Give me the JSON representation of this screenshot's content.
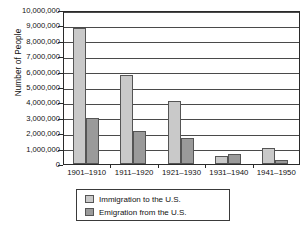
{
  "chart_data": {
    "type": "bar",
    "title": "",
    "xlabel": "",
    "ylabel": "Number of People",
    "ylim": [
      0,
      10000000
    ],
    "ytick_step": 1000000,
    "grid": true,
    "legend_position": "bottom",
    "categories": [
      "1901–1910",
      "1911–1920",
      "1921–1930",
      "1931–1940",
      "1941–1950"
    ],
    "series": [
      {
        "name": "Immigration to the U.S.",
        "color": "#c9c9c9",
        "values": [
          8800000,
          5750000,
          4110000,
          530000,
          1040000
        ]
      },
      {
        "name": "Emigration from the U.S.",
        "color": "#9a9a9a",
        "values": [
          3000000,
          2160000,
          1700000,
          650000,
          280000
        ]
      }
    ],
    "ytick_labels": [
      "0",
      "1,000,000",
      "2,000,000",
      "3,000,000",
      "4,000,000",
      "5,000,000",
      "6,000,000",
      "7,000,000",
      "8,000,000",
      "9,000,000",
      "10,000,000"
    ]
  },
  "axes": {
    "y_title": "Number of People"
  },
  "legend": {
    "entries": [
      {
        "label": "Immigration to the U.S.",
        "swatch": "light"
      },
      {
        "label": "Emigration from the U.S.",
        "swatch": "dark"
      }
    ]
  }
}
